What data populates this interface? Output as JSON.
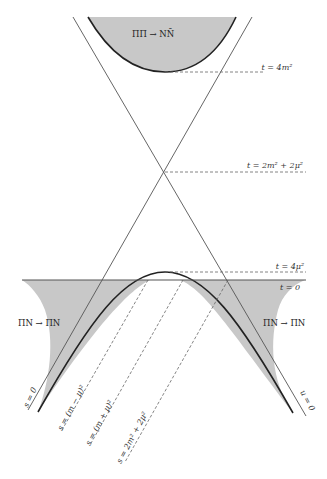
{
  "figure": {
    "type": "mandelstam-plane-diagram",
    "fill_color": "#c8c8c8",
    "line_color": "#555555",
    "curve_color": "#222222"
  },
  "regions": {
    "upper": {
      "label": "ΠΠ → NN̄"
    },
    "left": {
      "label": "ΠN → ΠN"
    },
    "right": {
      "label": "ΠN → ΠN"
    }
  },
  "horizontal_lines": {
    "t_4m2": {
      "label": "t = 4m²",
      "style": "dashed"
    },
    "t_2m2_2mu2": {
      "label": "t = 2m² + 2μ²",
      "style": "dashed"
    },
    "t_4mu2": {
      "label": "t = 4μ²",
      "style": "dashed"
    },
    "t_0": {
      "label": "t = 0",
      "style": "solid"
    }
  },
  "diagonal_lines": {
    "s_0": {
      "label": "s = 0",
      "style": "solid"
    },
    "u_0": {
      "label": "u = 0",
      "style": "solid"
    },
    "s_m_minus_mu": {
      "label": "s = (m − μ)²",
      "style": "dashed"
    },
    "s_m_plus_mu": {
      "label": "s = (m + μ)²",
      "style": "dashed"
    },
    "s_2m2_2mu2": {
      "label": "s = 2m² + 2μ²",
      "style": "dashed"
    }
  }
}
